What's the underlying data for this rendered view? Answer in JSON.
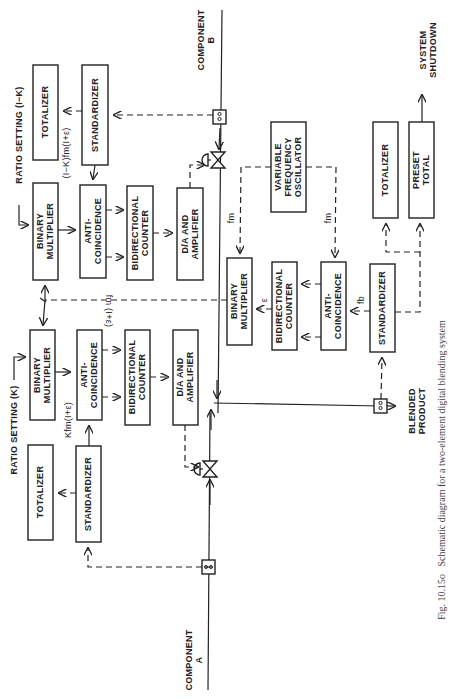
{
  "caption": {
    "fig": "Fig. 10.15o",
    "text": "Schematic diagram for a two-element digital blending system"
  },
  "inputs": {
    "component_a": [
      "COMPONENT",
      "A"
    ],
    "component_b": [
      "COMPONENT",
      "B"
    ]
  },
  "outputs": {
    "blended_product": [
      "BLENDED",
      "PRODUCT"
    ],
    "system_shutdown": [
      "SYSTEM",
      "SHUTDOWN"
    ]
  },
  "ratio_settings": {
    "k": "RATIO SETTING (K)",
    "one_minus_k": "RATIO SETTING (I−K)"
  },
  "signals": {
    "k_fm": "Kfm(I+ε)",
    "one_minus_k_fm": "(I−K)fm(I+ε)",
    "fm_eps": "fm (I+ε)",
    "fm1": "fm",
    "fm2": "fm",
    "eps": "ε",
    "fb": "fb"
  },
  "blocks": {
    "a_totalizer": [
      "TOTALIZER"
    ],
    "a_standardizer": [
      "STANDARDIZER"
    ],
    "a_multiplier": [
      "BINARY",
      "MULTIPLIER"
    ],
    "a_anticoincidence": [
      "ANTI-",
      "COINCIDENCE"
    ],
    "a_counter": [
      "BIDIRECTIONAL",
      "COUNTER"
    ],
    "a_da": [
      "D/A  AND",
      "AMPLIFIER"
    ],
    "b_totalizer": [
      "TOTALIZER"
    ],
    "b_standardizer": [
      "STANDARDIZER"
    ],
    "b_multiplier": [
      "BINARY",
      "MULTIPLIER"
    ],
    "b_anticoincidence": [
      "ANTI-",
      "COINCIDENCE"
    ],
    "b_counter": [
      "BIDIRECTIONAL",
      "COUNTER"
    ],
    "b_da": [
      "D/A  AND",
      "AMPLIFIER"
    ],
    "vfo": [
      "VARIABLE",
      "FREQUENCY",
      "OSCILLATOR"
    ],
    "p_multiplier": [
      "BINARY",
      "MULTIPLIER"
    ],
    "p_counter": [
      "BIDIRECTIONAL",
      "COUNTER"
    ],
    "p_anticoincidence": [
      "ANTI-",
      "COINCIDENCE"
    ],
    "p_standardizer": [
      "STANDARDIZER"
    ],
    "p_totalizer": [
      "TOTALIZER"
    ],
    "p_preset": [
      "PRESET",
      "TOTAL"
    ]
  }
}
